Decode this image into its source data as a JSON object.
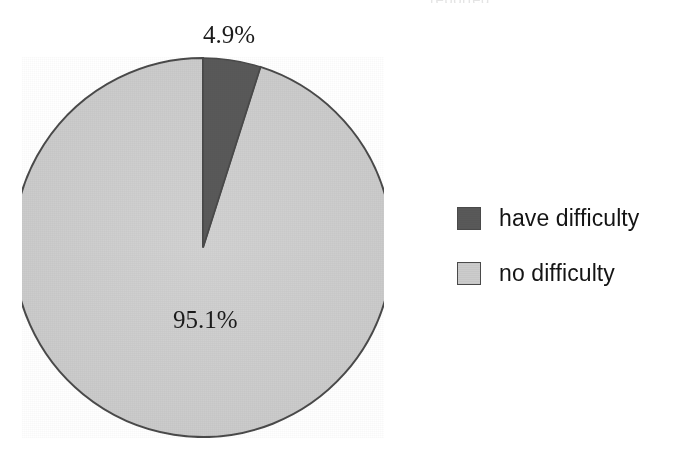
{
  "figure": {
    "background_color": "#ffffff",
    "cropped_title_remnant": "reported"
  },
  "legend": {
    "position": "right",
    "items": [
      {
        "label": "have difficulty",
        "color": "#595959",
        "swatch_name": "legend-swatch-have-difficulty"
      },
      {
        "label": "no difficulty",
        "color": "#cccccc",
        "swatch_name": "legend-swatch-no-difficulty"
      }
    ]
  },
  "labels": {
    "slice_1": "4.9%",
    "slice_2": "95.1%"
  },
  "chart_data": {
    "type": "pie",
    "title": "",
    "subtitle": "",
    "xlabel": "",
    "ylabel": "",
    "categories": [
      "have difficulty",
      "no difficulty"
    ],
    "values": [
      4.9,
      95.1
    ],
    "value_unit": "percent",
    "data_labels": [
      "4.9%",
      "95.1%"
    ],
    "colors": [
      "#595959",
      "#cccccc"
    ],
    "outline_color": "#4a4a4a",
    "start_angle_deg": 90,
    "direction": "clockwise",
    "legend": [
      "have difficulty",
      "no difficulty"
    ],
    "legend_position": "right",
    "grid": false,
    "annotations": []
  }
}
